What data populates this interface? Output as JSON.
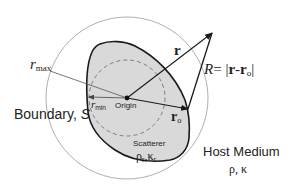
{
  "labels": {
    "r_max": {
      "main": "r",
      "sub": "max"
    },
    "r_min": {
      "main": "r",
      "sub": "min"
    },
    "origin": "Origin",
    "r_vector": "r",
    "r_o": {
      "main": "r",
      "sub": "o"
    },
    "R_formula": {
      "lhs": "R",
      "eq": "= ",
      "bar1": "|",
      "a": "r",
      "minus": "-",
      "b": "r",
      "bsub": "o",
      "bar2": "|"
    },
    "boundary": {
      "text": "Boundary, ",
      "symbol": "S"
    },
    "scatterer": {
      "name": "Scatterer",
      "props": {
        "rho": "ρ",
        "rho_sub": "r",
        "sep": ",",
        "kappa": "κ",
        "kappa_sub": "r"
      }
    },
    "host_medium": {
      "name": "Host Medium",
      "props": "ρ, κ"
    }
  },
  "colors": {
    "scatterer_fill": "#d9d9d9",
    "outline": "#1a1a1a",
    "thin_circle": "#9a9a9a",
    "dashed_circle": "#666666",
    "text": "#222222"
  }
}
